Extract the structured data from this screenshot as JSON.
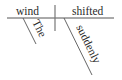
{
  "diagram": {
    "type": "reed-kellogg-sentence-diagram",
    "sentence_words": {
      "subject": "wind",
      "verb": "shifted",
      "subject_modifier": "The",
      "verb_modifier": "suddenly"
    },
    "colors": {
      "line": "#555555",
      "text": "#2a2a2a",
      "background": "#ffffff"
    }
  }
}
